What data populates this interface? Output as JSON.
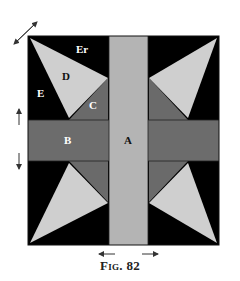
{
  "figure": {
    "caption": "Fig. 82",
    "colors": {
      "background": "#000000",
      "column_A": "#b4b4b4",
      "band_B": "#6c6c6c",
      "triangle_C": "#6a6a6a",
      "triangle_D": "#cfcfcf",
      "label_light": "#ffffff",
      "label_dark": "#111111",
      "arrow": "#333333"
    },
    "labels": {
      "A": "A",
      "B": "B",
      "C": "C",
      "D": "D",
      "E": "E",
      "Er": "Er"
    },
    "arrows": [
      {
        "name": "diagonal-double-arrow",
        "direction": "diagonal"
      },
      {
        "name": "up-arrow",
        "direction": "up"
      },
      {
        "name": "down-arrow",
        "direction": "down"
      },
      {
        "name": "left-arrow",
        "direction": "left"
      },
      {
        "name": "right-arrow",
        "direction": "right"
      }
    ]
  }
}
